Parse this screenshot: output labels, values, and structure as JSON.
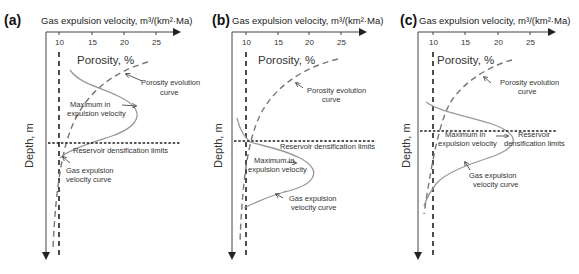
{
  "figure": {
    "panels": [
      {
        "id": "a",
        "letter": "(a)",
        "x_axis_title": "Gas expulsion velocity, m³/(km²·Ma)",
        "x_ticks": [
          "10",
          "15",
          "20",
          "25"
        ],
        "secondary_axis_label": "Porosity, %",
        "y_axis_label": "Depth, m",
        "annotations": {
          "porosity_curve": [
            "Porosity evolution",
            "curve"
          ],
          "maximum": [
            "Maximum in",
            "expulsion velocity"
          ],
          "limit": "Reservoir densification limits",
          "gas_curve": [
            "Gas expulsion",
            "velocity curve"
          ]
        },
        "description": "Maximum gas expulsion velocity occurs above reservoir densification limit"
      },
      {
        "id": "b",
        "letter": "(b)",
        "x_axis_title": "Gas expulsion velocity, m³/(km²·Ma)",
        "x_ticks": [
          "10",
          "15",
          "20",
          "25"
        ],
        "secondary_axis_label": "Porosity, %",
        "y_axis_label": "Depth, m",
        "annotations": {
          "porosity_curve": [
            "Porosity evolution",
            "curve"
          ],
          "maximum": [
            "Maximum in",
            "expulsion velocity"
          ],
          "limit": "Reservoir densification limits",
          "gas_curve": [
            "Gas expulsion",
            "velocity curve"
          ]
        },
        "description": "Maximum gas expulsion velocity occurs below reservoir densification limit"
      },
      {
        "id": "c",
        "letter": "(c)",
        "x_axis_title": "Gas expulsion velocity, m³/(km²·Ma)",
        "x_ticks": [
          "10",
          "15",
          "20",
          "25"
        ],
        "secondary_axis_label": "Porosity, %",
        "y_axis_label": "Depth, m",
        "annotations": {
          "porosity_curve": [
            "Porosity evolution",
            "curve"
          ],
          "maximum": [
            "Maximum in",
            "expulsion velocity"
          ],
          "limit": [
            "Reservoir",
            "densification limits"
          ],
          "gas_curve": [
            "Gas expulsion",
            "velocity curve"
          ]
        },
        "description": "Maximum gas expulsion velocity coincides with reservoir densification limit"
      }
    ],
    "colors": {
      "axis": "#444444",
      "threshold_line": "#222222",
      "porosity_curve": "#777777",
      "gas_curve": "#999999",
      "text": "#333333"
    }
  }
}
